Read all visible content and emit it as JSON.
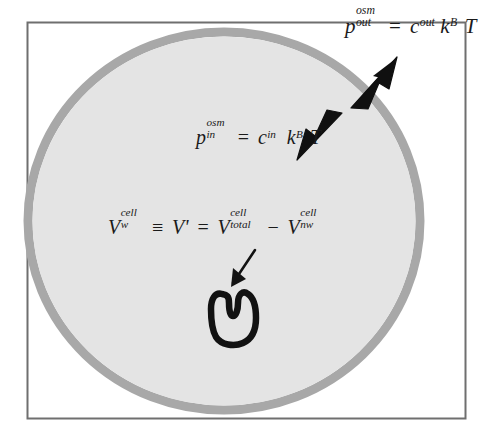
{
  "figure": {
    "frame": {
      "name": "figure-border",
      "color": "#7a7a7a"
    },
    "cell": {
      "name": "cell-circle",
      "fill_color": "#e3e3e3",
      "membrane_color": "#a6a6a6",
      "label": "cell"
    },
    "background_color": "#ffffff"
  },
  "equations": {
    "outside_pressure": {
      "name": "equation-osmotic-pressure-outside",
      "symbol": "p",
      "superscript": "osm",
      "subscript": "out",
      "relation": "=",
      "rhs_c": "c",
      "rhs_c_subscript": "out",
      "rhs_k": "k",
      "rhs_k_subscript": "B",
      "rhs_T": "T",
      "plain": "p_out^osm = c_out k_B T"
    },
    "inside_pressure": {
      "name": "equation-osmotic-pressure-inside",
      "symbol": "p",
      "superscript": "osm",
      "subscript": "in",
      "relation": "=",
      "rhs_c": "c",
      "rhs_c_subscript": "in",
      "rhs_k": "k",
      "rhs_k_subscript": "B",
      "rhs_T": "T",
      "plain": "p_in^osm = c_in k_B T"
    },
    "water_volume": {
      "name": "equation-cell-water-volume",
      "lhs_symbol": "V",
      "lhs_superscript": "cell",
      "lhs_subscript": "w",
      "identity": "≡",
      "vprime_symbol": "V",
      "vprime_mark": "'",
      "relation": "=",
      "total_symbol": "V",
      "total_superscript": "cell",
      "total_subscript": "total",
      "minus": "−",
      "nonwater_symbol": "V",
      "nonwater_superscript": "cell",
      "nonwater_subscript": "nw",
      "plain": "V_w^cell ≡ V' = V_total^cell − V_nw^cell"
    }
  },
  "annotations": {
    "arrow_inward": {
      "name": "arrow-osmotic-influx",
      "description": "thick block arrow pointing down-left into the cell membrane",
      "color": "#111111"
    },
    "arrow_outward": {
      "name": "arrow-osmotic-efflux",
      "description": "thick block arrow pointing up-right toward the cell membrane",
      "color": "#111111"
    },
    "arrow_to_blob": {
      "name": "arrow-pointer-to-nonwater-volume",
      "description": "thin arrow pointing down-left to the non-water volume blob",
      "color": "#111111"
    },
    "nonwater_blob": {
      "name": "nonwater-volume-blob",
      "description": "hand-drawn closed outline representing the non-water cell volume",
      "color": "#111111"
    }
  }
}
